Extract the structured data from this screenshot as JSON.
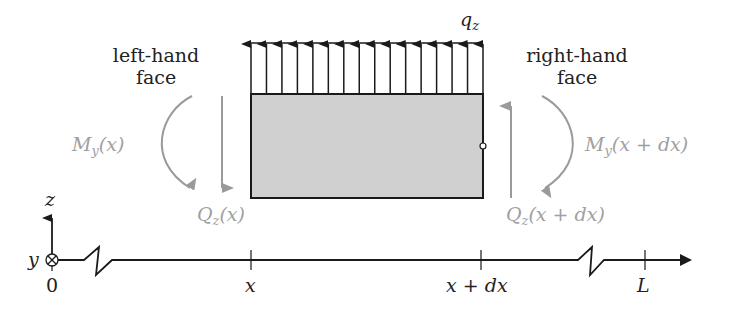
{
  "diagram": {
    "load_label": "q",
    "load_sub": "z",
    "load_arrow_count": 16,
    "left_face": {
      "line1": "left-hand",
      "line2": "face"
    },
    "right_face": {
      "line1": "right-hand",
      "line2": "face"
    },
    "moment_left": {
      "sym": "M",
      "sub": "y",
      "arg": "(x)"
    },
    "moment_right": {
      "sym": "M",
      "sub": "y",
      "arg": "(x + dx)"
    },
    "shear_left": {
      "sym": "Q",
      "sub": "z",
      "arg": "(x)"
    },
    "shear_right": {
      "sym": "Q",
      "sub": "z",
      "arg": "(x + dx)"
    },
    "axes": {
      "z": "z",
      "y": "y"
    },
    "ticks": [
      "0",
      "x",
      "x + dx",
      "L"
    ],
    "colors": {
      "line": "#1a1a1a",
      "fill": "#d0d0d0",
      "internal": "#9a9a9a"
    }
  }
}
